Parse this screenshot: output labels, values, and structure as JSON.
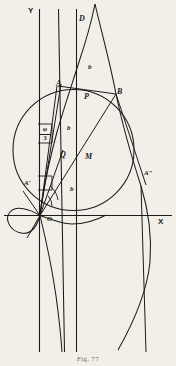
{
  "figure": {
    "caption": "Fig. 77",
    "background_color": "#f2efe9",
    "ink_color": "#1b1b1b",
    "width": 176,
    "height": 366,
    "axes": {
      "y_label": "Y",
      "x_label": "X",
      "origin_label": "O"
    },
    "points": [
      {
        "id": "point-a",
        "label": "A",
        "x": 56,
        "y": 87,
        "style": "italic"
      },
      {
        "id": "point-b-upper",
        "label": "B",
        "x": 117,
        "y": 95,
        "style": "italic"
      },
      {
        "id": "point-d",
        "label": "D",
        "x": 79,
        "y": 22,
        "style": "italic"
      },
      {
        "id": "point-p",
        "label": "P",
        "x": 84,
        "y": 100,
        "style": "italic"
      },
      {
        "id": "point-q",
        "label": "Q",
        "x": 60,
        "y": 158,
        "style": "italic"
      },
      {
        "id": "point-m",
        "label": "M",
        "x": 85,
        "y": 160,
        "style": "italic"
      },
      {
        "id": "point-a-prime",
        "label": "A′",
        "x": 26,
        "y": 186,
        "style": "italic"
      },
      {
        "id": "point-a-double-prime",
        "label": "A″",
        "x": 146,
        "y": 177,
        "style": "italic"
      },
      {
        "id": "point-origin",
        "label": "O",
        "x": 47,
        "y": 221,
        "style": "italic"
      }
    ],
    "segment_labels": [
      {
        "id": "segment-b-top",
        "label": "b",
        "x": 88,
        "y": 70
      },
      {
        "id": "segment-b-middle",
        "label": "b",
        "x": 67,
        "y": 131
      },
      {
        "id": "segment-b-lower",
        "label": "b",
        "x": 70,
        "y": 192
      }
    ],
    "angle_label": {
      "id": "angle-phi-over-three",
      "numerator": "φ",
      "denominator": "3",
      "x": 40,
      "y": 130
    }
  }
}
